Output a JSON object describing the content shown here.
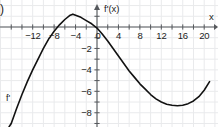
{
  "item_marker": ")",
  "axes": {
    "x_axis_label": "x",
    "y_axis_label": "f'(x)",
    "x_tick_labels": [
      "−12",
      "−8",
      "−4",
      "0",
      "4",
      "8",
      "12",
      "16",
      "20"
    ],
    "x_tick_values": [
      -12,
      -8,
      -4,
      0,
      4,
      8,
      12,
      16,
      20
    ],
    "y_tick_labels": [
      "0",
      "−2",
      "−4",
      "−6",
      "−8"
    ],
    "y_tick_values": [
      0,
      -2,
      -4,
      -6,
      -8
    ],
    "axis_color": "#55585c",
    "grid_color": "#e9eaec",
    "background_color": "#ffffff"
  },
  "curve": {
    "name_label": "f'",
    "color": "#121212",
    "stroke_width": 1.6
  },
  "chart_data": {
    "type": "line",
    "title": "",
    "subtitle": "",
    "xlabel": "x",
    "ylabel": "f'(x)",
    "xlim": [
      -17.5,
      21.5
    ],
    "ylim": [
      -9.6,
      1.8
    ],
    "grid": true,
    "legend": "none",
    "annotations": [
      {
        "text": ")",
        "position": "top-left-outside"
      },
      {
        "text": "f'(x)",
        "position": "above y-axis"
      },
      {
        "text": "x",
        "position": "right end of x-axis"
      },
      {
        "text": "f'",
        "position": "near lower-left branch of curve"
      }
    ],
    "x_ticks": [
      -12,
      -8,
      -4,
      0,
      4,
      8,
      12,
      16,
      20
    ],
    "y_ticks": [
      0,
      -2,
      -4,
      -6,
      -8
    ],
    "x_tick_step": 2,
    "y_tick_step": 1,
    "series": [
      {
        "name": "f'",
        "x": [
          -16.4,
          -16.0,
          -15.0,
          -14.0,
          -13.0,
          -12.0,
          -11.0,
          -10.0,
          -9.0,
          -8.7,
          -8.0,
          -7.0,
          -6.0,
          -5.0,
          -4.5,
          -4.0,
          -3.0,
          -2.0,
          -1.0,
          0.0,
          0.9,
          2.0,
          3.0,
          4.0,
          5.0,
          6.0,
          7.0,
          8.0,
          9.0,
          10.0,
          11.0,
          12.0,
          13.0,
          14.0,
          15.0,
          16.0,
          17.0,
          18.0,
          19.0,
          20.0,
          21.0
        ],
        "y": [
          -9.3,
          -9.0,
          -7.6,
          -6.3,
          -5.1,
          -4.0,
          -3.0,
          -2.0,
          -1.1,
          -0.9,
          -0.4,
          0.2,
          0.7,
          1.1,
          1.2,
          1.1,
          0.9,
          0.6,
          0.3,
          -0.1,
          -0.6,
          -1.3,
          -2.0,
          -2.7,
          -3.4,
          -4.1,
          -4.7,
          -5.3,
          -5.8,
          -6.3,
          -6.7,
          -7.0,
          -7.2,
          -7.3,
          -7.35,
          -7.3,
          -7.15,
          -6.9,
          -6.5,
          -5.9,
          -5.1
        ]
      }
    ],
    "features": {
      "x_intercepts": [
        -8.7,
        0.9
      ],
      "local_maximum": {
        "x": -4.5,
        "y": 1.2
      },
      "local_minimum": {
        "x": 15.4,
        "y": -7.35
      }
    }
  }
}
